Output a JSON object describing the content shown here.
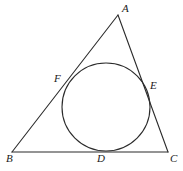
{
  "figure": {
    "name": "triangle-with-inscribed-circle",
    "stroke_color": "#2b2b2b",
    "fill_color": "none",
    "background_color": "#ffffff"
  },
  "labels": {
    "apex": "A",
    "bottom_left": "B",
    "bottom_right": "C",
    "tangent_bottom": "D",
    "tangent_right": "E",
    "tangent_left": "F"
  },
  "geometry": {
    "triangle": {
      "A": {
        "x": 118,
        "y": 15
      },
      "B": {
        "x": 12,
        "y": 152
      },
      "C": {
        "x": 168,
        "y": 152
      }
    },
    "incircle": {
      "cx": 106,
      "cy": 107,
      "r": 44
    },
    "tangent_points": {
      "D": {
        "x": 101,
        "y": 151
      },
      "E": {
        "x": 147,
        "y": 85
      },
      "F": {
        "x": 66,
        "y": 81
      }
    },
    "label_positions": {
      "A": {
        "x": 122,
        "y": 3
      },
      "B": {
        "x": 6,
        "y": 153
      },
      "C": {
        "x": 170,
        "y": 153
      },
      "D": {
        "x": 97,
        "y": 153
      },
      "E": {
        "x": 150,
        "y": 80
      },
      "F": {
        "x": 54,
        "y": 73
      }
    }
  }
}
